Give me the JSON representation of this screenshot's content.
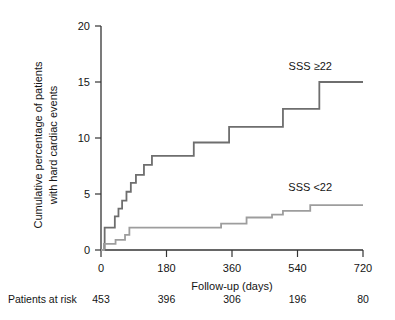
{
  "chart_data": {
    "type": "line",
    "title": "",
    "subtitle": "",
    "xlabel": "Follow-up (days)",
    "ylabel": "Cumulative percentage of patients with hard cardiac events",
    "ylabel_line1": "Cumulative percentage of patients",
    "ylabel_line2": "with hard cardiac events",
    "xlim": [
      0,
      720
    ],
    "ylim": [
      0,
      20
    ],
    "xticks": [
      0,
      180,
      360,
      540,
      720
    ],
    "xtick_labels": [
      "0",
      "180",
      "360",
      "540",
      "720"
    ],
    "yticks": [
      0,
      5,
      10,
      15,
      20
    ],
    "ytick_labels": [
      "0",
      "5",
      "10",
      "15",
      "20"
    ],
    "grid": false,
    "legend_position": "inline-right",
    "step_style": "post",
    "series": [
      {
        "name": "SSS ≥22",
        "label": "SSS ≥22",
        "color": "#6e6e6e",
        "label_x": 575,
        "label_y": 16.1,
        "x": [
          0,
          10,
          28,
          38,
          48,
          58,
          70,
          82,
          96,
          118,
          140,
          170,
          200,
          255,
          300,
          352,
          360,
          470,
          500,
          560,
          600,
          720
        ],
        "y": [
          0,
          2.0,
          2.0,
          3.0,
          3.7,
          4.4,
          5.2,
          6.0,
          6.7,
          7.6,
          8.4,
          8.4,
          8.4,
          9.6,
          9.6,
          11.0,
          11.0,
          11.0,
          12.6,
          12.6,
          15.0,
          15.0
        ]
      },
      {
        "name": "SSS <22",
        "label": "SSS <22",
        "color": "#9d9d9d",
        "label_x": 575,
        "label_y": 5.3,
        "x": [
          0,
          8,
          24,
          40,
          52,
          66,
          78,
          120,
          300,
          330,
          360,
          400,
          430,
          470,
          500,
          540,
          575,
          600,
          720
        ],
        "y": [
          0,
          0.55,
          0.55,
          0.9,
          0.9,
          1.35,
          2.0,
          2.0,
          2.0,
          2.35,
          2.35,
          2.9,
          2.9,
          3.15,
          3.5,
          3.5,
          4.0,
          4.0,
          4.0
        ]
      }
    ],
    "risk_table": {
      "label": "Patients at risk",
      "times": [
        0,
        180,
        360,
        540,
        720
      ],
      "values": [
        "453",
        "396",
        "306",
        "196",
        "80"
      ]
    }
  }
}
